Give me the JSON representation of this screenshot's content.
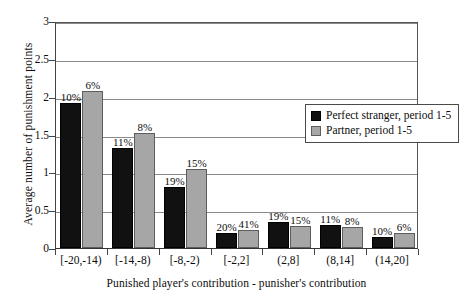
{
  "chart_data": {
    "type": "bar",
    "title": "",
    "xlabel": "Punished player's contribution - punisher's contribution",
    "ylabel": "Average number of punishment points",
    "categories": [
      "[-20,-14)",
      "[-14,-8)",
      "[-8,-2)",
      "[-2,2]",
      "(2,8]",
      "(8,14]",
      "(14,20]"
    ],
    "ylim": [
      0,
      3
    ],
    "yticks": [
      "0",
      "0.5",
      "1",
      "1.5",
      "2",
      "2.5",
      "3"
    ],
    "ytick_values": [
      0,
      0.5,
      1,
      1.5,
      2,
      2.5,
      3
    ],
    "grid": true,
    "legend_position": "upper-right-inside",
    "series": [
      {
        "name": "Perfect stranger,  period 1-5",
        "color": "#111111",
        "values": [
          1.92,
          1.32,
          0.81,
          0.2,
          0.34,
          0.31,
          0.14
        ],
        "point_labels": [
          "10%",
          "11%",
          "19%",
          "20%",
          "19%",
          "11%",
          "10%"
        ]
      },
      {
        "name": "Partner,  period 1-5",
        "color": "#a6a6a6",
        "values": [
          2.08,
          1.52,
          1.04,
          0.24,
          0.29,
          0.28,
          0.2
        ],
        "point_labels": [
          "6%",
          "8%",
          "15%",
          "41%",
          "15%",
          "8%",
          "6%"
        ]
      }
    ]
  }
}
